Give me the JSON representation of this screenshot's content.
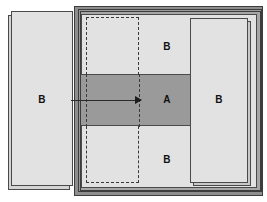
{
  "diagram": {
    "type": "technical-illustration",
    "labels": {
      "left_panel": "B",
      "top_region": "B",
      "center_band": "A",
      "bottom_region": "B",
      "right_panel": "B"
    },
    "colors": {
      "background": "#ffffff",
      "light_fill": "#e2e2e2",
      "mid_fill": "#9a9a9a",
      "frame_fill": "#8e8e8e",
      "outline": "#4a4a4a",
      "dashed_outline": "#3a3a3a",
      "arrow": "#1c1c1c",
      "shadow_fill": "#d4d4d4",
      "label_text": "#111111"
    },
    "annotations": {
      "arrow_direction": "left-to-right",
      "arrow_meaning": "insertion of left panel B into assembly"
    }
  }
}
